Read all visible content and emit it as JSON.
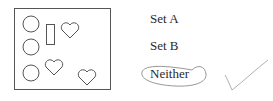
{
  "question": {
    "figure": {
      "shapes": [
        {
          "type": "circle",
          "label": "circle"
        },
        {
          "type": "circle",
          "label": "circle"
        },
        {
          "type": "circle",
          "label": "circle"
        },
        {
          "type": "rectangle",
          "label": "rectangle"
        },
        {
          "type": "heart",
          "label": "heart"
        },
        {
          "type": "heart",
          "label": "heart"
        },
        {
          "type": "heart",
          "label": "heart"
        }
      ]
    },
    "options": [
      {
        "label": "Set A",
        "selected": false
      },
      {
        "label": "Set B",
        "selected": false
      },
      {
        "label": "Neither",
        "selected": true
      }
    ],
    "feedback": {
      "mark": "checkmark",
      "correct": true
    },
    "colors": {
      "stroke": "#555555",
      "ink": "#888888",
      "text": "#2a2a2a"
    }
  }
}
